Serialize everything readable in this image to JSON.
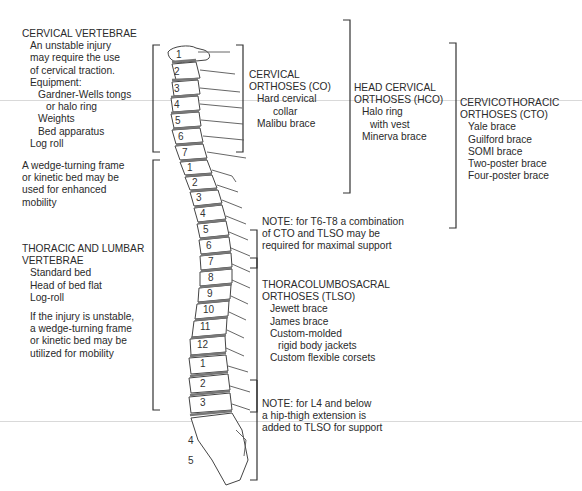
{
  "left_panel": {
    "cervical": {
      "title": "CERVICAL VERTEBRAE",
      "lines": [
        "An unstable injury",
        "may require the use",
        "of cervical traction.",
        "Equipment:"
      ],
      "equipment": [
        "Gardner-Wells tongs",
        "or halo ring",
        "Weights",
        "Bed apparatus"
      ],
      "last": "Log roll"
    },
    "wedge_note": [
      "A wedge-turning frame",
      "or kinetic bed may be",
      "used for enhanced",
      "mobility"
    ],
    "thoracic_lumbar": {
      "title_line1": "THORACIC AND LUMBAR",
      "title_line2": "VERTEBRAE",
      "items": [
        "Standard bed",
        "Head of bed flat",
        "Log-roll"
      ],
      "unstable": [
        "If the injury is unstable,",
        "a wedge-turning frame",
        "or kinetic bed may be",
        "utilized for mobility"
      ]
    }
  },
  "spine": {
    "cervical_labels": [
      "1",
      "2",
      "3",
      "4",
      "5",
      "6",
      "7"
    ],
    "thoracic_labels": [
      "1",
      "2",
      "3",
      "4",
      "5",
      "6",
      "7",
      "8",
      "9",
      "10",
      "11",
      "12"
    ],
    "lumbar_labels": [
      "1",
      "2",
      "3",
      "4",
      "5"
    ]
  },
  "orthoses": {
    "co": {
      "title1": "CERVICAL",
      "title2": "ORTHOSES (CO)",
      "items": [
        "Hard cervical",
        "collar",
        "Malibu brace"
      ]
    },
    "hco": {
      "title1": "HEAD CERVICAL",
      "title2": "ORTHOSES (HCO)",
      "items": [
        "Halo ring",
        "with vest",
        "Minerva brace"
      ]
    },
    "cto": {
      "title1": "CERVICOTHORACIC",
      "title2": "ORTHOSES (CTO)",
      "items": [
        "Yale brace",
        "Guilford brace",
        "SOMI brace",
        "Two-poster brace",
        "Four-poster brace"
      ]
    },
    "note_t6": [
      "NOTE: for T6-T8 a combination",
      "of CTO and TLSO may be",
      "required for maximal support"
    ],
    "tlso": {
      "title1": "THORACOLUMBOSACRAL",
      "title2": "ORTHOSES (TLSO)",
      "items": [
        "Jewett brace",
        "James brace",
        "Custom-molded",
        "rigid body jackets",
        "Custom flexible corsets"
      ]
    },
    "note_l4": [
      "NOTE: for L4 and below",
      "a hip-thigh extension is",
      "added to TLSO for support"
    ]
  }
}
